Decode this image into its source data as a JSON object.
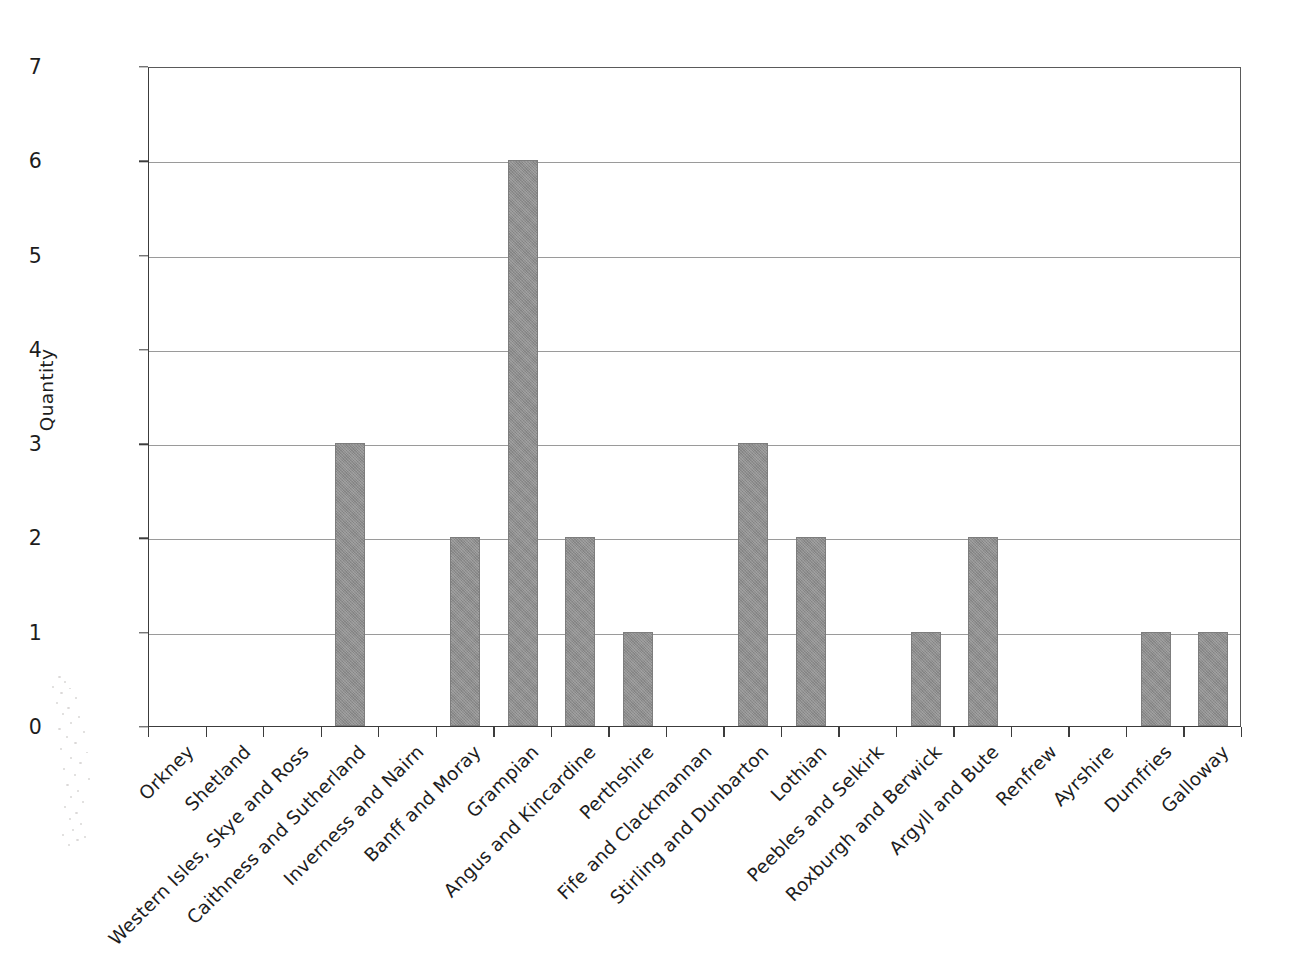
{
  "figure": {
    "y_axis_title": "Quantity",
    "bar_color": "#8e8e8e",
    "gridline_color": "#9a9a9a",
    "axis_color": "#3c3c3c",
    "background": "#ffffff"
  },
  "chart_data": {
    "type": "bar",
    "title": "",
    "xlabel": "",
    "ylabel": "Quantity",
    "ylim": [
      0,
      7
    ],
    "ytick_labels": [
      "0",
      "1",
      "2",
      "3",
      "4",
      "5",
      "6",
      "7"
    ],
    "ytick_values": [
      0,
      1,
      2,
      3,
      4,
      5,
      6,
      7
    ],
    "grid": "horizontal",
    "legend": "none",
    "categories": [
      "Orkney",
      "Shetland",
      "Western Isles, Skye and Ross",
      "Caithness and Sutherland",
      "Inverness and Nairn",
      "Banff and Moray",
      "Grampian",
      "Angus and Kincardine",
      "Perthshire",
      "Fife and Clackmannan",
      "Stirling and Dunbarton",
      "Lothian",
      "Peebles and Selkirk",
      "Roxburgh and Berwick",
      "Argyll and Bute",
      "Renfrew",
      "Ayrshire",
      "Dumfries",
      "Galloway"
    ],
    "values": [
      0,
      0,
      0,
      3,
      0,
      2,
      6,
      2,
      1,
      0,
      3,
      2,
      0,
      1,
      2,
      0,
      0,
      1,
      1
    ]
  }
}
